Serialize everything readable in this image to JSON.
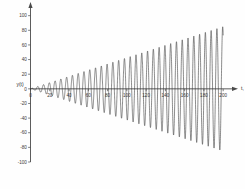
{
  "chart_data": {
    "type": "line",
    "title": "",
    "subtitle": "",
    "xlabel": "t, s",
    "ylabel": "y(t)",
    "xlim": [
      0,
      205
    ],
    "ylim": [
      -100,
      105
    ],
    "grid": false,
    "legend": null,
    "legend_position": "none",
    "annotations": [],
    "x_ticks": [
      0,
      20,
      40,
      60,
      80,
      100,
      120,
      140,
      160,
      180,
      200
    ],
    "x_tick_labels": [
      "0",
      "20",
      "40",
      "60",
      "80",
      "100",
      "120",
      "140",
      "160",
      "180",
      "200"
    ],
    "y_ticks": [
      -100,
      -80,
      -60,
      -40,
      -20,
      0,
      20,
      40,
      60,
      80,
      100
    ],
    "y_tick_labels": [
      "-100",
      "-80",
      "-60",
      "-40",
      "-20",
      "0",
      "20",
      "40",
      "60",
      "80",
      "100"
    ],
    "series": [
      {
        "name": "y(t)",
        "color": "#2d2d2d",
        "envelope_slope": 0.425,
        "period": 6.0,
        "amplitude_at_t200": 85,
        "points_note": "y(t) = 0.425 * t * sin(2*pi*t/6)"
      }
    ]
  },
  "axes": {
    "x_axis_name": "time-axis",
    "y_axis_name": "amplitude-axis",
    "x_arrow": true,
    "y_arrow": true
  }
}
